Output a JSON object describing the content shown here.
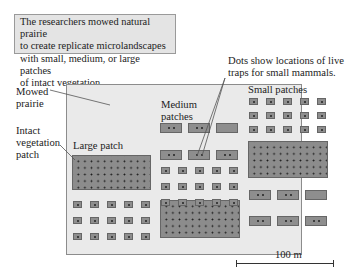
{
  "caption": {
    "lines": [
      "The researchers mowed natural prairie",
      "to create replicate microlandscapes",
      "with small, medium, or large patches",
      "of intact vegetation."
    ]
  },
  "labels": {
    "traps_line1": "Dots show locations of live",
    "traps_line2": "traps for small mammals.",
    "mowed_line1": "Mowed",
    "mowed_line2": "prairie",
    "intact_line1": "Intact",
    "intact_line2": "vegetation",
    "intact_line3": "patch",
    "large_patch": "Large patch",
    "medium_line1": "Medium",
    "medium_line2": "patches",
    "small_patches": "Small patches"
  },
  "scale_bar": {
    "label": "100 m"
  },
  "colors": {
    "background": "#ffffff",
    "caption_box": "#e4e4e4",
    "mowed_field": "#eaeaea",
    "patch_fill": "#8e8e8e",
    "dot": "#1a1a1a"
  }
}
